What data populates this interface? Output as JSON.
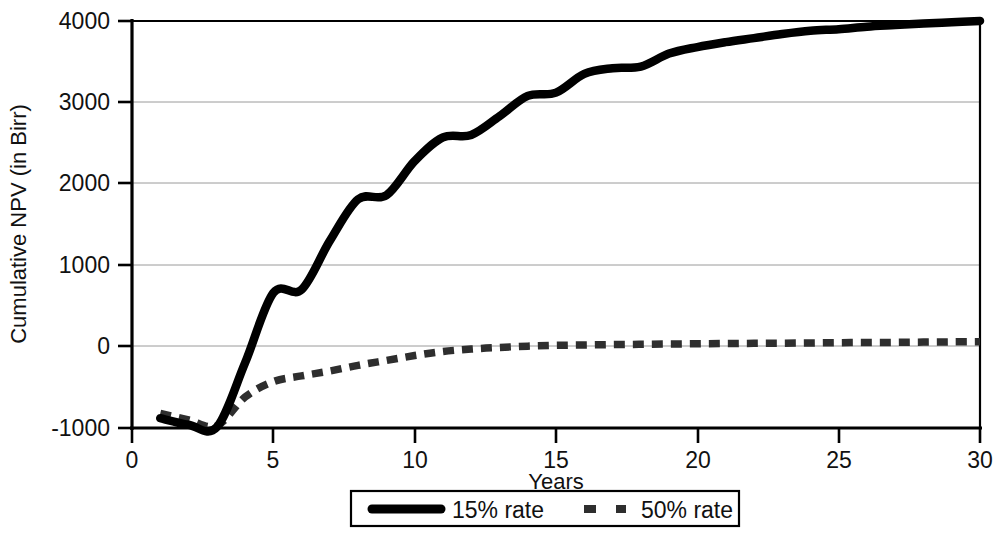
{
  "chart_data": {
    "type": "line",
    "title": "",
    "xlabel": "Years",
    "ylabel": "Cumulative NPV (in Birr)",
    "xlim": [
      0,
      30
    ],
    "ylim": [
      -1000,
      4000
    ],
    "xticks": [
      0,
      5,
      10,
      15,
      20,
      25,
      30
    ],
    "xtick_labels": [
      "0",
      "5",
      "10",
      "15",
      "20",
      "25",
      "30"
    ],
    "yticks": [
      -1000,
      0,
      1000,
      2000,
      3000,
      4000
    ],
    "ytick_labels": [
      "-1000",
      "0",
      "1000",
      "2000",
      "3000",
      "4000"
    ],
    "grid": true,
    "grid_axis": "y",
    "legend_position": "bottom-center",
    "x": [
      1,
      2,
      3,
      4,
      5,
      6,
      7,
      8,
      9,
      10,
      11,
      12,
      13,
      14,
      15,
      16,
      17,
      18,
      19,
      20,
      21,
      22,
      23,
      24,
      25,
      26,
      27,
      28,
      29,
      30
    ],
    "series": [
      {
        "name": "15% rate",
        "style": "solid",
        "color": "#000000",
        "values": [
          -880,
          -960,
          -990,
          -200,
          660,
          700,
          1300,
          1810,
          1860,
          2280,
          2570,
          2600,
          2830,
          3080,
          3120,
          3350,
          3420,
          3440,
          3600,
          3680,
          3740,
          3790,
          3840,
          3880,
          3900,
          3930,
          3950,
          3970,
          3985,
          4000
        ]
      },
      {
        "name": "50% rate",
        "style": "dashed",
        "color": "#2e2e2e",
        "values": [
          -820,
          -900,
          -975,
          -620,
          -430,
          -360,
          -300,
          -230,
          -170,
          -110,
          -60,
          -30,
          -10,
          5,
          15,
          20,
          25,
          28,
          32,
          35,
          38,
          40,
          42,
          45,
          48,
          50,
          52,
          55,
          58,
          60
        ]
      }
    ],
    "legend": [
      {
        "label": "15% rate",
        "style": "solid"
      },
      {
        "label": "50% rate",
        "style": "dashed"
      }
    ]
  },
  "geometry": {
    "plot_left": 132,
    "plot_right": 980,
    "plot_top": 21,
    "plot_bottom": 428
  }
}
